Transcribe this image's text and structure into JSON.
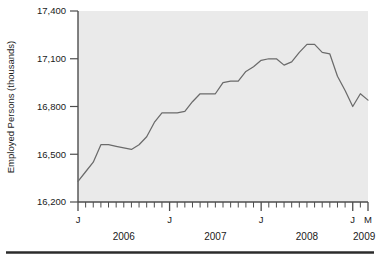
{
  "chart_data": {
    "type": "line",
    "title": "",
    "subtitle": "",
    "xlabel": "",
    "ylabel": "Employed Persons (thousands)",
    "ylim": [
      16200,
      17400
    ],
    "yticks": [
      16200,
      16500,
      16800,
      17100,
      17400
    ],
    "ytick_labels": [
      "16,200",
      "16,500",
      "16,800",
      "17,100",
      "17,400"
    ],
    "grid": false,
    "legend": "none",
    "plot_background": "#eaeaea",
    "line_color": "#6b6b6b",
    "axis_color": "#4d4d4d",
    "x_axis_type": "monthly ticks, January labelled J for each year, final tick M",
    "xtick_major_labels": [
      "J",
      "J",
      "J",
      "J",
      "M"
    ],
    "year_labels": [
      "2006",
      "2007",
      "2008",
      "2009"
    ],
    "x": [
      "2006-01",
      "2006-02",
      "2006-03",
      "2006-04",
      "2006-05",
      "2006-06",
      "2006-07",
      "2006-08",
      "2006-09",
      "2006-10",
      "2006-11",
      "2006-12",
      "2007-01",
      "2007-02",
      "2007-03",
      "2007-04",
      "2007-05",
      "2007-06",
      "2007-07",
      "2007-08",
      "2007-09",
      "2007-10",
      "2007-11",
      "2007-12",
      "2008-01",
      "2008-02",
      "2008-03",
      "2008-04",
      "2008-05",
      "2008-06",
      "2008-07",
      "2008-08",
      "2008-09",
      "2008-10",
      "2008-11",
      "2008-12",
      "2009-01",
      "2009-02",
      "2009-03"
    ],
    "values": [
      16330,
      16390,
      16450,
      16560,
      16560,
      16550,
      16540,
      16530,
      16560,
      16610,
      16700,
      16760,
      16760,
      16760,
      16770,
      16830,
      16880,
      16880,
      16880,
      16950,
      16960,
      16960,
      17020,
      17050,
      17090,
      17100,
      17100,
      17060,
      17080,
      17140,
      17190,
      17190,
      17140,
      17130,
      16990,
      16900,
      16800,
      16880,
      16840
    ],
    "series_name": "Employed Persons"
  },
  "axis": {
    "ylabel": "Employed Persons (thousands)",
    "ytick_labels": [
      "17,400",
      "17,100",
      "16,800",
      "16,500",
      "16,200"
    ],
    "month_labels": [
      "J",
      "J",
      "J",
      "J",
      "M"
    ],
    "year_labels": [
      "2006",
      "2007",
      "2008",
      "2009"
    ]
  }
}
